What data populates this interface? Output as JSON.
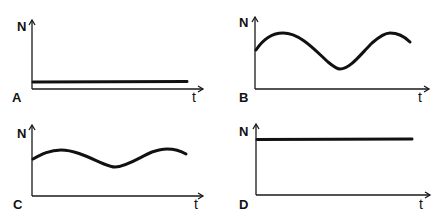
{
  "panels": [
    {
      "id": "A",
      "letter": "A",
      "y_label": "N",
      "x_label": "t",
      "shape": "constant-low"
    },
    {
      "id": "B",
      "letter": "B",
      "y_label": "N",
      "x_label": "t",
      "shape": "oscillating-large-amplitude"
    },
    {
      "id": "C",
      "letter": "C",
      "y_label": "N",
      "x_label": "t",
      "shape": "oscillating-small-amplitude"
    },
    {
      "id": "D",
      "letter": "D",
      "y_label": "N",
      "x_label": "t",
      "shape": "constant-high"
    }
  ],
  "colors": {
    "ink": "#111111",
    "background": "#ffffff"
  }
}
